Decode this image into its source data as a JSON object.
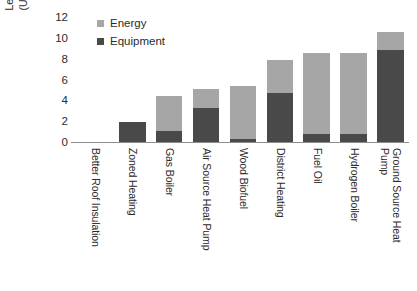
{
  "chart_data": {
    "type": "bar",
    "subtype": "stacked-vertical",
    "title": "",
    "xlabel": "",
    "ylabel": "Levelised Cost of Heating (USD cent per kWh of heat)",
    "ylabel_lines": [
      "Levelised Cost of Heating",
      "(USD cent per kWh of heat)"
    ],
    "ylim": [
      0,
      12
    ],
    "yticks": [
      12,
      10,
      8,
      6,
      4,
      2,
      0
    ],
    "ytick_labels": [
      "12",
      "10",
      "8",
      "6",
      "4",
      "2",
      "0"
    ],
    "grid": false,
    "legend_position": "top-left-inside",
    "categories": [
      "Better Roof Insulation",
      "Zoned Heating",
      "Gas Boiler",
      "Air Source Heat Pump",
      "Wood Biofuel",
      "District Heating",
      "Fuel Oil",
      "Hydrogen Boiler",
      "Ground Source Heat Pump"
    ],
    "series": [
      {
        "name": "Equipment",
        "color": "#494949",
        "values": [
          0.05,
          2.0,
          1.15,
          3.4,
          0.35,
          4.8,
          0.9,
          0.9,
          8.9
        ]
      },
      {
        "name": "Energy",
        "color": "#a6a6a6",
        "values": [
          0.0,
          0.0,
          3.35,
          1.8,
          5.15,
          3.2,
          7.7,
          7.7,
          1.8
        ]
      }
    ],
    "totals": [
      0.05,
      2.0,
      4.5,
      5.2,
      5.5,
      8.0,
      8.6,
      8.6,
      10.7
    ]
  },
  "legend": {
    "items": [
      {
        "label": "Energy",
        "color": "#a6a6a6"
      },
      {
        "label": "Equipment",
        "color": "#494949"
      }
    ]
  },
  "colors": {
    "energy": "#a6a6a6",
    "equipment": "#494949",
    "axis": "#8c8c8c",
    "text": "#2b2b2b",
    "background": "#ffffff"
  }
}
